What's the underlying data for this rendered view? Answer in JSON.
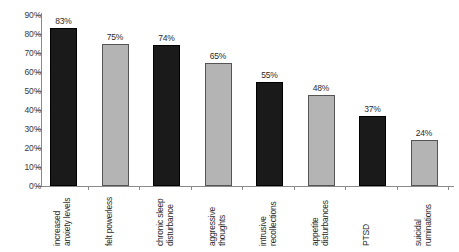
{
  "chart_data": {
    "type": "bar",
    "title": "",
    "subtitle": "",
    "xlabel": "",
    "ylabel": "",
    "ylim": [
      0,
      90
    ],
    "ytick_labels": [
      "0%",
      "10%",
      "20%",
      "30%",
      "40%",
      "50%",
      "60%",
      "70%",
      "80%",
      "90%"
    ],
    "ytick_values": [
      0,
      10,
      20,
      30,
      40,
      50,
      60,
      70,
      80,
      90
    ],
    "grid": false,
    "legend": false,
    "categories": [
      "increased\nanxiety levels",
      "felt powerless",
      "chronic sleep\ndisturbance",
      "aggressive\nthoughts",
      "intrusive\nrecollections",
      "appetite\ndisturbances",
      "PTSD",
      "suicidal\nruminations"
    ],
    "values": [
      83,
      75,
      74,
      65,
      55,
      48,
      37,
      24
    ],
    "value_labels": [
      "83%",
      "75%",
      "74%",
      "65%",
      "55%",
      "48%",
      "37%",
      "24%"
    ],
    "bar_colors": [
      "#1a1a1a",
      "#b4b4b4",
      "#1a1a1a",
      "#b4b4b4",
      "#1a1a1a",
      "#b4b4b4",
      "#1a1a1a",
      "#b4b4b4"
    ]
  }
}
